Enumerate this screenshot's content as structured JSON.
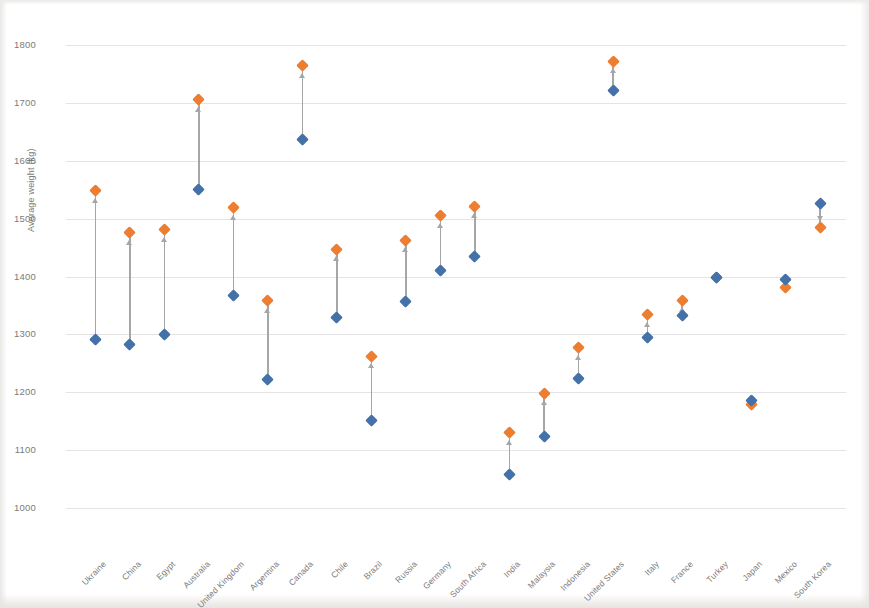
{
  "chart_data": {
    "type": "scatter",
    "title": "",
    "xlabel": "",
    "ylabel": "Average weight (kg)",
    "ylim": [
      1000,
      1800
    ],
    "ytick_step": 100,
    "yticks": [
      1800,
      1700,
      1600,
      1500,
      1400,
      1300,
      1200,
      1100,
      1000
    ],
    "grid": true,
    "legend": "none",
    "marker_shape": "diamond",
    "connector": "arrow",
    "categories": [
      "Ukraine",
      "China",
      "Egypt",
      "Australia",
      "United Kingdom",
      "Argentina",
      "Canada",
      "Chile",
      "Brazil",
      "Russia",
      "Germany",
      "South Africa",
      "India",
      "Malaysia",
      "Indonesia",
      "United States",
      "Italy",
      "France",
      "Turkey",
      "Japan",
      "Mexico",
      "South Korea"
    ],
    "series": [
      {
        "name": "Start",
        "color": "#4472A8",
        "values": [
          1291,
          1283,
          1299,
          1550,
          1368,
          1222,
          1636,
          1330,
          1152,
          1356,
          1410,
          1435,
          1058,
          1124,
          1224,
          1722,
          1295,
          1333,
          1399,
          1186,
          1394,
          1526
        ]
      },
      {
        "name": "End",
        "color": "#ED7D31",
        "values": [
          1548,
          1476,
          1481,
          1705,
          1519,
          1358,
          1764,
          1447,
          1262,
          1463,
          1505,
          1521,
          1130,
          1198,
          1277,
          1772,
          1334,
          1359,
          1399,
          1179,
          1381,
          1484
        ]
      }
    ],
    "colors": {
      "start_marker": "#4472A8",
      "end_marker": "#ED7D31",
      "connector": "#A6A6A6",
      "gridline": "#E4E4E4",
      "tick_text": "#7B7B7B"
    }
  }
}
